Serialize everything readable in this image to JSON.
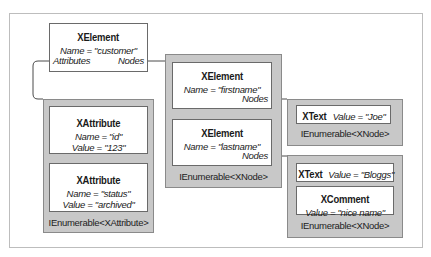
{
  "diagram": {
    "root": {
      "type": "XElement",
      "name_line": "Name = \"customer\"",
      "ports": {
        "attributes": "Attributes",
        "nodes": "Nodes"
      }
    },
    "attributes_collection": {
      "label": "IEnumerable<XAttribute>",
      "items": [
        {
          "type": "XAttribute",
          "name_line": "Name = \"id\"",
          "value_line": "Value = \"123\""
        },
        {
          "type": "XAttribute",
          "name_line": "Name = \"status\"",
          "value_line": "Value = \"archived\""
        }
      ]
    },
    "nodes_collection": {
      "label": "IEnumerable<XNode>",
      "items": [
        {
          "type": "XElement",
          "name_line": "Name = \"firstname\"",
          "port": "Nodes"
        },
        {
          "type": "XElement",
          "name_line": "Name = \"lastname\"",
          "port": "Nodes"
        }
      ]
    },
    "firstname_nodes": {
      "label": "IEnumerable<XNode>",
      "items": [
        {
          "type": "XText",
          "value_line": "Value = \"Joe\""
        }
      ]
    },
    "lastname_nodes": {
      "label": "IEnumerable<XNode>",
      "items": [
        {
          "type": "XText",
          "value_line": "Value = \"Bloggs\""
        },
        {
          "type": "XComment",
          "value_line": "Value = \"nice name\""
        }
      ]
    },
    "colors": {
      "container_fill": "#c8c8c8",
      "box_fill": "#ffffff",
      "line": "#4a4a4a"
    }
  }
}
